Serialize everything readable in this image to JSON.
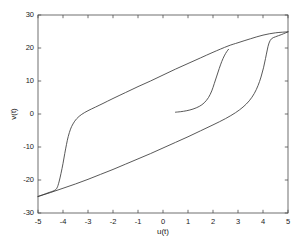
{
  "chart_data": {
    "type": "line",
    "title": "",
    "subtitle": "",
    "xlabel": "u(t)",
    "ylabel": "v(t)",
    "xlim": [
      -5,
      5
    ],
    "ylim": [
      -30,
      30
    ],
    "xticks": [
      -5,
      -4,
      -3,
      -2,
      -1,
      0,
      1,
      2,
      3,
      4,
      5
    ],
    "xticklabels": [
      "-5",
      "-4",
      "-3",
      "-2",
      "-1",
      "0",
      "1",
      "2",
      "3",
      "4",
      "5"
    ],
    "yticks": [
      -30,
      -20,
      -10,
      0,
      10,
      20,
      30
    ],
    "yticklabels": [
      "-30",
      "-20",
      "-10",
      "0",
      "10",
      "20",
      "30"
    ],
    "grid": false,
    "legend": null,
    "legend_position": "none",
    "line_color": "#3a3a3a",
    "axes_color": "#4d4d4d",
    "background_color": "#ffffff",
    "annotations": [],
    "series": [
      {
        "name": "upper-branch",
        "description": "Major hysteresis loop upper branch: steep rise near u=-4 then near-linear to u=5",
        "points": [
          [
            -5.0,
            -25.0
          ],
          [
            -4.6,
            -23.9
          ],
          [
            -4.35,
            -23.2
          ],
          [
            -4.24,
            -22.4
          ],
          [
            -4.16,
            -20.6
          ],
          [
            -4.08,
            -18.0
          ],
          [
            -4.0,
            -15.0
          ],
          [
            -3.93,
            -12.0
          ],
          [
            -3.86,
            -9.2
          ],
          [
            -3.79,
            -6.8
          ],
          [
            -3.7,
            -4.6
          ],
          [
            -3.6,
            -3.0
          ],
          [
            -3.45,
            -1.4
          ],
          [
            -3.25,
            -0.1
          ],
          [
            -3.0,
            1.0
          ],
          [
            -2.7,
            2.1
          ],
          [
            -2.4,
            3.2
          ],
          [
            -2.0,
            4.7
          ],
          [
            -1.5,
            6.5
          ],
          [
            -1.0,
            8.3
          ],
          [
            -0.5,
            10.0
          ],
          [
            0.0,
            11.8
          ],
          [
            0.5,
            13.6
          ],
          [
            1.0,
            15.3
          ],
          [
            1.5,
            17.0
          ],
          [
            2.0,
            18.7
          ],
          [
            2.6,
            20.6
          ],
          [
            3.0,
            21.6
          ],
          [
            3.5,
            22.8
          ],
          [
            4.0,
            23.9
          ],
          [
            4.5,
            24.6
          ],
          [
            5.0,
            24.9
          ]
        ]
      },
      {
        "name": "lower-branch",
        "description": "Major hysteresis loop lower branch: near-linear from u=-5 then steep rise near u=4",
        "points": [
          [
            -5.0,
            -25.0
          ],
          [
            -4.5,
            -23.8
          ],
          [
            -4.0,
            -22.5
          ],
          [
            -3.5,
            -21.2
          ],
          [
            -3.0,
            -19.8
          ],
          [
            -2.5,
            -18.3
          ],
          [
            -2.0,
            -16.8
          ],
          [
            -1.5,
            -15.2
          ],
          [
            -1.0,
            -13.6
          ],
          [
            -0.5,
            -12.0
          ],
          [
            0.0,
            -10.3
          ],
          [
            0.5,
            -8.6
          ],
          [
            1.0,
            -6.9
          ],
          [
            1.5,
            -5.1
          ],
          [
            2.0,
            -3.3
          ],
          [
            2.5,
            -1.4
          ],
          [
            2.9,
            0.4
          ],
          [
            3.2,
            2.1
          ],
          [
            3.45,
            4.0
          ],
          [
            3.65,
            6.2
          ],
          [
            3.8,
            8.6
          ],
          [
            3.92,
            11.2
          ],
          [
            4.02,
            14.0
          ],
          [
            4.1,
            16.8
          ],
          [
            4.17,
            19.4
          ],
          [
            4.24,
            21.5
          ],
          [
            4.34,
            22.8
          ],
          [
            4.5,
            23.4
          ],
          [
            4.75,
            24.1
          ],
          [
            5.0,
            24.9
          ]
        ]
      },
      {
        "name": "inner-minor-loop",
        "description": "Inner minor reversal curve starting near (0.5, 0.5) rising steeply to meet upper branch near (2.6, 19.5)",
        "points": [
          [
            0.5,
            0.55
          ],
          [
            0.7,
            0.7
          ],
          [
            0.95,
            1.0
          ],
          [
            1.2,
            1.5
          ],
          [
            1.45,
            2.3
          ],
          [
            1.65,
            3.4
          ],
          [
            1.82,
            5.0
          ],
          [
            1.95,
            7.0
          ],
          [
            2.05,
            9.2
          ],
          [
            2.15,
            11.5
          ],
          [
            2.25,
            13.8
          ],
          [
            2.35,
            15.9
          ],
          [
            2.45,
            17.6
          ],
          [
            2.55,
            18.9
          ],
          [
            2.62,
            19.6
          ]
        ]
      }
    ]
  },
  "axes": {
    "xtick_positions_px": [
      38,
      63,
      88,
      113,
      138,
      163,
      188,
      213,
      238,
      263,
      288
    ],
    "ytick_positions_px": [
      213,
      180,
      147,
      114,
      81,
      48,
      15
    ],
    "plot_left_px": 38,
    "plot_right_px": 288,
    "plot_top_px": 15,
    "plot_bottom_px": 213
  }
}
